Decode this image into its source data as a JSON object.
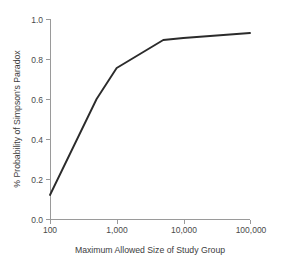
{
  "chart_data": {
    "type": "line",
    "title": "",
    "subtitle": "",
    "xlabel": "Maximum Allowed Size of Study Group",
    "ylabel": "% Probability of Simpson's Paradox",
    "xscale": "log",
    "yscale": "linear",
    "xlim": [
      100,
      100000
    ],
    "ylim": [
      0.0,
      1.0
    ],
    "grid": false,
    "legend": null,
    "x_tick_labels": [
      "100",
      "1,000",
      "10,000",
      "100,000"
    ],
    "x_tick_values": [
      100,
      1000,
      10000,
      100000
    ],
    "y_tick_labels": [
      "0.0",
      "0.2",
      "0.4",
      "0.6",
      "0.8",
      "1.0"
    ],
    "y_tick_values": [
      0.0,
      0.2,
      0.4,
      0.6,
      0.8,
      1.0
    ],
    "series": [
      {
        "name": "Probability of Simpson's Paradox",
        "color": "#2b2b2b",
        "x": [
          100,
          500,
          1000,
          5000,
          10000,
          100000
        ],
        "values": [
          0.12,
          0.6,
          0.755,
          0.895,
          0.905,
          0.93
        ]
      }
    ],
    "annotations": []
  },
  "figure": {
    "background_color": "#ffffff",
    "axis_color": "#9a9a9a",
    "text_color": "#3d3d3d"
  }
}
